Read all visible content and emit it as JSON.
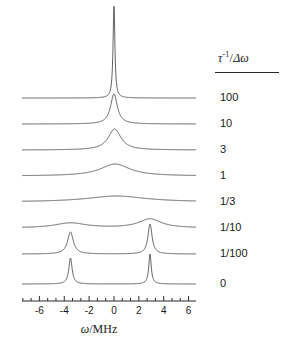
{
  "figure": {
    "background": "#ffffff",
    "line_color": "#3a3a3a",
    "axis_color": "#2b2b2b"
  },
  "axis": {
    "label_omega": "ω",
    "label_separator": "/",
    "label_unit": "MHz",
    "tick_labels": [
      "-6",
      "-4",
      "-2",
      "0",
      "2",
      "4",
      "6"
    ],
    "tick_values": [
      -6,
      -4,
      -2,
      0,
      2,
      4,
      6
    ],
    "minor_ticks_per_interval": 2,
    "xlim": [
      -7.4,
      6.6
    ]
  },
  "legend": {
    "header_tau": "τ",
    "header_exponent": "-1",
    "header_slash": "/",
    "header_delta_omega": "Δω",
    "items": [
      "100",
      "10",
      "3",
      "1",
      "1/3",
      "1/10",
      "1/100",
      "0"
    ]
  },
  "chart_data": {
    "type": "line",
    "title": "",
    "xlabel": "ω / MHz",
    "ylabel": "",
    "xlim": [
      -7.4,
      6.6
    ],
    "grid": false,
    "legend_position": "right",
    "legend_title": "τ⁻¹/Δω",
    "site_positions": [
      -3.5,
      2.9
    ],
    "series": [
      {
        "name": "100",
        "baseline_y": 98,
        "peaks": [
          {
            "center": 0.0,
            "height": 92,
            "hwhm": 0.09
          }
        ]
      },
      {
        "name": "10",
        "baseline_y": 124,
        "peaks": [
          {
            "center": 0.0,
            "height": 30,
            "hwhm": 0.33
          }
        ]
      },
      {
        "name": "3",
        "baseline_y": 150,
        "peaks": [
          {
            "center": 0.05,
            "height": 21,
            "hwhm": 0.62
          }
        ]
      },
      {
        "name": "1",
        "baseline_y": 176,
        "peaks": [
          {
            "center": 0.1,
            "height": 12,
            "hwhm": 1.45
          }
        ]
      },
      {
        "name": "1/3",
        "baseline_y": 202,
        "peaks": [
          {
            "center": 0.2,
            "height": 6,
            "hwhm": 2.9
          }
        ]
      },
      {
        "name": "1/10",
        "baseline_y": 228,
        "peaks": [
          {
            "center": -3.5,
            "height": 5,
            "hwhm": 1.5
          },
          {
            "center": 2.9,
            "height": 9,
            "hwhm": 1.1
          }
        ]
      },
      {
        "name": "1/100",
        "baseline_y": 254,
        "peaks": [
          {
            "center": -3.5,
            "height": 22,
            "hwhm": 0.28
          },
          {
            "center": 2.9,
            "height": 30,
            "hwhm": 0.2
          }
        ]
      },
      {
        "name": "0",
        "baseline_y": 284,
        "peaks": [
          {
            "center": -3.5,
            "height": 26,
            "hwhm": 0.16
          },
          {
            "center": 2.9,
            "height": 30,
            "hwhm": 0.12
          }
        ]
      }
    ]
  }
}
